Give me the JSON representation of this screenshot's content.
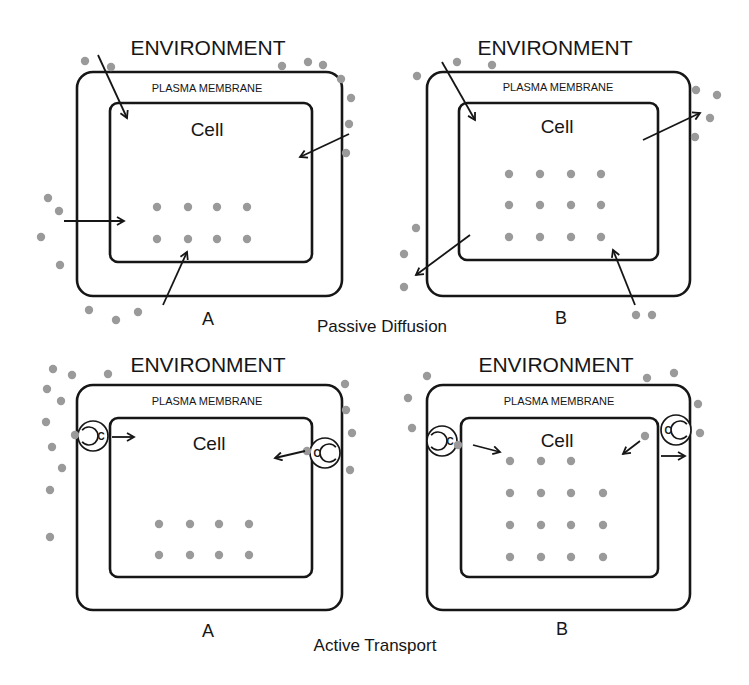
{
  "figure": {
    "background": "#ffffff",
    "ink_color": "#161616",
    "molecule_color": "#9a9a9a",
    "captions": {
      "passive": "Passive Diffusion",
      "active": "Active Transport"
    },
    "panels": [
      {
        "id": "passive-a",
        "environment_label": "ENVIRONMENT",
        "membrane_label": "PLASMA MEMBRANE",
        "cell_label": "Cell",
        "sub_label": "A",
        "outer": {
          "x": 77,
          "y": 72,
          "w": 265,
          "h": 224,
          "r": 16
        },
        "inner": {
          "x": 110,
          "y": 103,
          "w": 202,
          "h": 159,
          "r": 8
        },
        "env_pos": [
          208,
          55
        ],
        "pm_pos": [
          207,
          92
        ],
        "cell_pos": [
          207,
          136
        ],
        "sub_pos": [
          208,
          325
        ],
        "inside_dots": [
          [
            157,
            207
          ],
          [
            188,
            207
          ],
          [
            217,
            207
          ],
          [
            247,
            207
          ],
          [
            157,
            239
          ],
          [
            188,
            239
          ],
          [
            217,
            239
          ],
          [
            247,
            239
          ]
        ],
        "outside_dots": [
          [
            85,
            61
          ],
          [
            111,
            67
          ],
          [
            282,
            66
          ],
          [
            308,
            62
          ],
          [
            323,
            65
          ],
          [
            341,
            79
          ],
          [
            351,
            98
          ],
          [
            349,
            124
          ],
          [
            346,
            153
          ],
          [
            48,
            198
          ],
          [
            59,
            211
          ],
          [
            41,
            237
          ],
          [
            60,
            265
          ],
          [
            89,
            310
          ],
          [
            116,
            320
          ],
          [
            138,
            312
          ]
        ],
        "arrows": [
          [
            98,
            55,
            127,
            118
          ],
          [
            349,
            134,
            300,
            157
          ],
          [
            64,
            221,
            124,
            221
          ],
          [
            163,
            305,
            187,
            252
          ]
        ],
        "carriers": []
      },
      {
        "id": "passive-b",
        "environment_label": "ENVIRONMENT",
        "membrane_label": "PLASMA MEMBRANE",
        "cell_label": "Cell",
        "sub_label": "B",
        "outer": {
          "x": 427,
          "y": 72,
          "w": 263,
          "h": 224,
          "r": 16
        },
        "inner": {
          "x": 459,
          "y": 103,
          "w": 199,
          "h": 157,
          "r": 8
        },
        "env_pos": [
          555,
          55
        ],
        "pm_pos": [
          558,
          91
        ],
        "cell_pos": [
          557,
          133
        ],
        "sub_pos": [
          561,
          324
        ],
        "inside_dots": [
          [
            509,
            174
          ],
          [
            540,
            174
          ],
          [
            571,
            174
          ],
          [
            601,
            174
          ],
          [
            509,
            205
          ],
          [
            540,
            205
          ],
          [
            571,
            205
          ],
          [
            601,
            205
          ],
          [
            509,
            237
          ],
          [
            540,
            237
          ],
          [
            571,
            237
          ],
          [
            601,
            237
          ]
        ],
        "outside_dots": [
          [
            417,
            76
          ],
          [
            457,
            62
          ],
          [
            492,
            65
          ],
          [
            696,
            90
          ],
          [
            717,
            95
          ],
          [
            710,
            118
          ],
          [
            695,
            137
          ],
          [
            416,
            228
          ],
          [
            404,
            254
          ],
          [
            404,
            287
          ],
          [
            636,
            315
          ],
          [
            652,
            315
          ]
        ],
        "arrows": [
          [
            442,
            62,
            475,
            120
          ],
          [
            643,
            140,
            700,
            113
          ],
          [
            470,
            235,
            416,
            275
          ],
          [
            635,
            305,
            613,
            250
          ]
        ],
        "carriers": []
      },
      {
        "id": "active-a",
        "environment_label": "ENVIRONMENT",
        "membrane_label": "PLASMA MEMBRANE",
        "cell_label": "Cell",
        "sub_label": "A",
        "outer": {
          "x": 77,
          "y": 385,
          "w": 265,
          "h": 225,
          "r": 16
        },
        "inner": {
          "x": 110,
          "y": 418,
          "w": 202,
          "h": 159,
          "r": 8
        },
        "env_pos": [
          208,
          372
        ],
        "pm_pos": [
          207,
          405
        ],
        "cell_pos": [
          209,
          450
        ],
        "sub_pos": [
          208,
          637
        ],
        "inside_dots": [
          [
            159,
            524
          ],
          [
            190,
            524
          ],
          [
            219,
            524
          ],
          [
            249,
            524
          ],
          [
            159,
            555
          ],
          [
            190,
            555
          ],
          [
            219,
            555
          ],
          [
            249,
            555
          ]
        ],
        "outside_dots": [
          [
            53,
            369
          ],
          [
            72,
            375
          ],
          [
            108,
            374
          ],
          [
            47,
            389
          ],
          [
            61,
            401
          ],
          [
            46,
            422
          ],
          [
            52,
            447
          ],
          [
            62,
            468
          ],
          [
            50,
            490
          ],
          [
            50,
            537
          ],
          [
            345,
            384
          ],
          [
            346,
            410
          ],
          [
            352,
            433
          ],
          [
            350,
            470
          ]
        ],
        "arrows": [
          [
            112,
            437,
            134,
            437
          ],
          [
            305,
            451,
            275,
            458
          ]
        ],
        "carriers": [
          {
            "cx": 93,
            "cy": 436,
            "r": 15,
            "side": "left",
            "letter": "C",
            "dot": [
              75,
              435
            ]
          },
          {
            "cx": 325,
            "cy": 453,
            "r": 15,
            "side": "right",
            "letter": "C",
            "dot": [
              307,
              451
            ]
          }
        ]
      },
      {
        "id": "active-b",
        "environment_label": "ENVIRONMENT",
        "membrane_label": "PLASMA MEMBRANE",
        "cell_label": "Cell",
        "sub_label": "B",
        "outer": {
          "x": 427,
          "y": 385,
          "w": 263,
          "h": 225,
          "r": 16
        },
        "inner": {
          "x": 461,
          "y": 418,
          "w": 197,
          "h": 159,
          "r": 8
        },
        "env_pos": [
          556,
          372
        ],
        "pm_pos": [
          559,
          405
        ],
        "cell_pos": [
          557,
          447
        ],
        "sub_pos": [
          562,
          635
        ],
        "inside_dots": [
          [
            510,
            461
          ],
          [
            541,
            461
          ],
          [
            571,
            461
          ],
          [
            510,
            493
          ],
          [
            541,
            493
          ],
          [
            571,
            493
          ],
          [
            603,
            493
          ],
          [
            510,
            525
          ],
          [
            541,
            525
          ],
          [
            571,
            525
          ],
          [
            603,
            525
          ],
          [
            510,
            557
          ],
          [
            541,
            557
          ],
          [
            571,
            557
          ],
          [
            603,
            557
          ]
        ],
        "outside_dots": [
          [
            427,
            376
          ],
          [
            408,
            398
          ],
          [
            412,
            428
          ],
          [
            647,
            378
          ],
          [
            674,
            373
          ],
          [
            698,
            404
          ],
          [
            700,
            433
          ]
        ],
        "arrows": [
          [
            473,
            445,
            500,
            452
          ],
          [
            640,
            441,
            623,
            454
          ],
          [
            661,
            456,
            685,
            456
          ]
        ],
        "carriers": [
          {
            "cx": 442,
            "cy": 441,
            "r": 15,
            "side": "left",
            "letter": "C",
            "dot": [
              458,
              445
            ]
          },
          {
            "cx": 676,
            "cy": 430,
            "r": 15,
            "side": "right",
            "letter": "C",
            "dot": [
              645,
              436
            ]
          }
        ]
      }
    ]
  }
}
